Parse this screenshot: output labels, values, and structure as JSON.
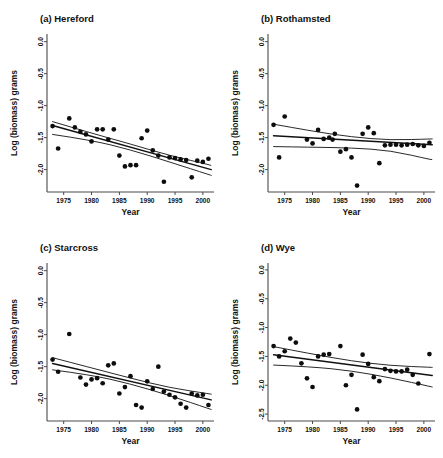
{
  "figure": {
    "name": "four-panel-scatter-regression",
    "background": "#ffffff",
    "point_color": "#0d0d0d",
    "line_color": "#111111",
    "axis_color": "#4a4a4a"
  },
  "chart_data": [
    {
      "type": "scatter",
      "panel_id": "a",
      "title": "(a) Hereford",
      "xlabel": "Year",
      "ylabel": "Log (biomass) grams",
      "xlim": [
        1972.0,
        2002.0
      ],
      "ylim": [
        -2.35,
        0.12
      ],
      "xticks": [
        1975,
        1980,
        1985,
        1990,
        1995,
        2000
      ],
      "xticklabels": [
        "1975",
        "1980",
        "1985",
        "1990",
        "1995",
        "2000"
      ],
      "yticks": [
        0.0,
        -0.5,
        -1.0,
        -1.5,
        -2.0
      ],
      "yticklabels": [
        "0.0",
        "-0.5",
        "-1.0",
        "-1.5",
        "-2.0"
      ],
      "grid": false,
      "legend": "none",
      "x": [
        1973,
        1974,
        1976,
        1977,
        1978,
        1979,
        1980,
        1981,
        1982,
        1983,
        1984,
        1985,
        1986,
        1987,
        1988,
        1989,
        1990,
        1991,
        1992,
        1993,
        1994,
        1995,
        1996,
        1997,
        1998,
        1999,
        2000,
        2001
      ],
      "y": [
        -1.32,
        -1.67,
        -1.2,
        -1.34,
        -1.41,
        -1.45,
        -1.56,
        -1.37,
        -1.37,
        -1.53,
        -1.37,
        -1.78,
        -1.95,
        -1.93,
        -1.93,
        -1.51,
        -1.39,
        -1.7,
        -1.78,
        -2.19,
        -1.81,
        -1.82,
        -1.84,
        -1.85,
        -2.12,
        -1.86,
        -1.88,
        -1.83
      ],
      "fit_line": {
        "name": "regression",
        "x": [
          1973.0,
          2001.5
        ],
        "y": [
          -1.31,
          -2.0
        ]
      },
      "ci_upper": {
        "name": "upper-confidence-band",
        "x": [
          1973.0,
          1980.0,
          1987.0,
          1994.0,
          2001.5
        ],
        "y": [
          -1.25,
          -1.43,
          -1.6,
          -1.78,
          -1.93
        ]
      },
      "ci_lower": {
        "name": "lower-confidence-band",
        "x": [
          1973.0,
          1980.0,
          1987.0,
          1994.0,
          2001.5
        ],
        "y": [
          -1.45,
          -1.54,
          -1.69,
          -1.88,
          -2.09
        ]
      }
    },
    {
      "type": "scatter",
      "panel_id": "b",
      "title": "(b) Rothamsted",
      "xlabel": "Year",
      "ylabel": "Log (biomass) grams",
      "xlim": [
        1972.0,
        2002.0
      ],
      "ylim": [
        -2.35,
        0.12
      ],
      "xticks": [
        1975,
        1980,
        1985,
        1990,
        1995,
        2000
      ],
      "xticklabels": [
        "1975",
        "1980",
        "1985",
        "1990",
        "1995",
        "2000"
      ],
      "yticks": [
        0.0,
        -0.5,
        -1.0,
        -1.5,
        -2.0
      ],
      "yticklabels": [
        "0.0",
        "-0.5",
        "-1.0",
        "-1.5",
        "-2.0"
      ],
      "grid": false,
      "legend": "none",
      "x": [
        1973,
        1974,
        1975,
        1979,
        1980,
        1981,
        1982,
        1983,
        1983.6,
        1984,
        1985,
        1986,
        1987,
        1988,
        1989,
        1990,
        1991,
        1992,
        1993,
        1994,
        1995,
        1996,
        1997,
        1998,
        1999,
        2000,
        2001
      ],
      "y": [
        -1.3,
        -1.81,
        -1.17,
        -1.53,
        -1.59,
        -1.38,
        -1.52,
        -1.5,
        -1.53,
        -1.44,
        -1.72,
        -1.68,
        -1.81,
        -2.25,
        -1.44,
        -1.34,
        -1.43,
        -1.9,
        -1.62,
        -1.61,
        -1.61,
        -1.62,
        -1.61,
        -1.6,
        -1.62,
        -1.63,
        -1.58
      ],
      "fit_line": {
        "name": "regression",
        "x": [
          1973.0,
          2001.5
        ],
        "y": [
          -1.47,
          -1.61
        ]
      },
      "ci_upper": {
        "name": "upper-confidence-band",
        "x": [
          1973.0,
          1980.0,
          1987.0,
          1994.0,
          2001.5
        ],
        "y": [
          -1.29,
          -1.4,
          -1.49,
          -1.54,
          -1.52
        ]
      },
      "ci_lower": {
        "name": "lower-confidence-band",
        "x": [
          1973.0,
          1980.0,
          1987.0,
          1994.0,
          2001.5
        ],
        "y": [
          -1.64,
          -1.65,
          -1.66,
          -1.7,
          -1.85
        ]
      }
    },
    {
      "type": "scatter",
      "panel_id": "c",
      "title": "(c) Starcross",
      "xlabel": "Year",
      "ylabel": "Log (biomass) grams",
      "xlim": [
        1972.0,
        2002.0
      ],
      "ylim": [
        -2.35,
        0.12
      ],
      "xticks": [
        1975,
        1980,
        1985,
        1990,
        1995,
        2000
      ],
      "xticklabels": [
        "1975",
        "1980",
        "1985",
        "1990",
        "1995",
        "2000"
      ],
      "yticks": [
        0.0,
        -0.5,
        -1.0,
        -1.5,
        -2.0
      ],
      "yticklabels": [
        "0.0",
        "-0.5",
        "-1.0",
        "-1.5",
        "-2.0"
      ],
      "grid": false,
      "legend": "none",
      "x": [
        1973,
        1974,
        1976,
        1978,
        1979,
        1980,
        1981,
        1982,
        1983,
        1984,
        1985,
        1986,
        1987,
        1988,
        1989,
        1990,
        1991,
        1992,
        1993,
        1994,
        1995,
        1996,
        1997,
        1998,
        1999,
        2000,
        2001
      ],
      "y": [
        -1.39,
        -1.58,
        -0.99,
        -1.67,
        -1.78,
        -1.7,
        -1.68,
        -1.76,
        -1.48,
        -1.45,
        -1.92,
        -1.82,
        -1.65,
        -2.1,
        -2.14,
        -1.73,
        -1.85,
        -1.5,
        -1.89,
        -1.94,
        -1.98,
        -2.08,
        -2.14,
        -1.92,
        -1.95,
        -1.94,
        -2.1
      ],
      "fit_line": {
        "name": "regression",
        "x": [
          1973.0,
          2001.5
        ],
        "y": [
          -1.45,
          -2.02
        ]
      },
      "ci_upper": {
        "name": "upper-confidence-band",
        "x": [
          1973.0,
          1980.0,
          1987.0,
          1994.0,
          2001.5
        ],
        "y": [
          -1.36,
          -1.52,
          -1.68,
          -1.83,
          -1.93
        ]
      },
      "ci_lower": {
        "name": "lower-confidence-band",
        "x": [
          1973.0,
          1980.0,
          1987.0,
          1994.0,
          2001.5
        ],
        "y": [
          -1.55,
          -1.63,
          -1.77,
          -1.95,
          -2.17
        ]
      }
    },
    {
      "type": "scatter",
      "panel_id": "d",
      "title": "(d) Wye",
      "xlabel": "Year",
      "ylabel": "Log (biomass) grams",
      "xlim": [
        1972.0,
        2002.0
      ],
      "ylim": [
        -2.62,
        0.12
      ],
      "xticks": [
        1975,
        1980,
        1985,
        1990,
        1995,
        2000
      ],
      "xticklabels": [
        "1975",
        "1980",
        "1985",
        "1990",
        "1995",
        "2000"
      ],
      "yticks": [
        0.0,
        -0.5,
        -1.0,
        -1.5,
        -2.0,
        -2.5
      ],
      "yticklabels": [
        "0.0",
        "-0.5",
        "-1.0",
        "-1.5",
        "-2.0",
        "-2.5"
      ],
      "grid": false,
      "legend": "none",
      "x": [
        1973,
        1974,
        1975,
        1976,
        1977,
        1978,
        1979,
        1980,
        1981,
        1982,
        1983,
        1985,
        1986,
        1987,
        1988,
        1989,
        1990,
        1991,
        1992,
        1993,
        1994,
        1995,
        1996,
        1997,
        1998,
        1999,
        2001
      ],
      "y": [
        -1.32,
        -1.5,
        -1.41,
        -1.19,
        -1.26,
        -1.62,
        -1.88,
        -2.03,
        -1.5,
        -1.47,
        -1.46,
        -1.32,
        -2.0,
        -1.82,
        -2.42,
        -1.47,
        -1.63,
        -1.86,
        -1.93,
        -1.72,
        -1.75,
        -1.76,
        -1.76,
        -1.73,
        -1.82,
        -1.97,
        -1.46
      ],
      "fit_line": {
        "name": "regression",
        "x": [
          1973.0,
          2001.5
        ],
        "y": [
          -1.47,
          -1.83
        ]
      },
      "ci_upper": {
        "name": "upper-confidence-band",
        "x": [
          1973.0,
          1980.0,
          1987.0,
          1994.0,
          2001.5
        ],
        "y": [
          -1.33,
          -1.46,
          -1.58,
          -1.66,
          -1.69
        ]
      },
      "ci_lower": {
        "name": "lower-confidence-band",
        "x": [
          1973.0,
          1980.0,
          1987.0,
          1994.0,
          2001.5
        ],
        "y": [
          -1.65,
          -1.68,
          -1.75,
          -1.87,
          -2.03
        ]
      }
    }
  ]
}
